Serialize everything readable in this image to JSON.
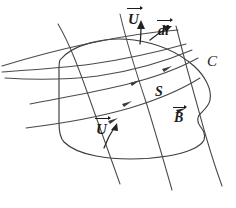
{
  "figure": {
    "domain": "Diagram",
    "background_color": "#ffffff",
    "ink_color": "#3c3c3c",
    "label_color": "#1c1c1c",
    "width": 236,
    "height": 208,
    "labels": {
      "u_top": "U",
      "dl": "dl",
      "c": "C",
      "s": "S",
      "b": "B",
      "u_bottom": "U"
    },
    "label_notes": {
      "u_top": "velocity vector U with overarrow, at top edge of surface",
      "dl": "line element vector dl with overarrow, tangent to boundary C",
      "c": "boundary curve C of the surface (no overarrow, italic)",
      "s": "surface S label inside the region (italic)",
      "b": "magnetic field vector B with overarrow",
      "u_bottom": "velocity vector U with overarrow, at bottom edge of surface"
    },
    "elements": [
      "closed boundary curve C enclosing surface S",
      "three magnetic field lines B crossing the surface from upper left to lower right",
      "direction arrowheads on the field lines pointing up-right",
      "velocity vector U arrow on the top boundary",
      "velocity vector U arrow on the bottom boundary",
      "line element vector dl tangent to the boundary near the top"
    ]
  }
}
